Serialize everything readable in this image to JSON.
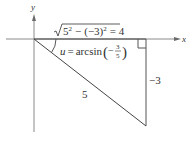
{
  "diagram": {
    "type": "right-triangle-on-axes",
    "axes": {
      "x_label": "x",
      "y_label": "y"
    },
    "labels": {
      "adjacent_side": {
        "radicand_base_1": "5",
        "exponent_1": "2",
        "minus": "−",
        "radicand_base_2": "(−3)",
        "exponent_2": "2",
        "equals": "= 4",
        "full_text": "√(5² − (−3)²) = 4"
      },
      "angle": {
        "var": "u",
        "equals": "=",
        "func": "arcsin",
        "minus": "−",
        "numerator": "3",
        "denominator": "5",
        "full_text": "u = arcsin(−3/5)"
      },
      "hypotenuse": "5",
      "opposite_side": "−3"
    },
    "colors": {
      "axis": "#8a8a8a",
      "line": "#333333",
      "text": "#333333",
      "background": "#ffffff"
    }
  }
}
